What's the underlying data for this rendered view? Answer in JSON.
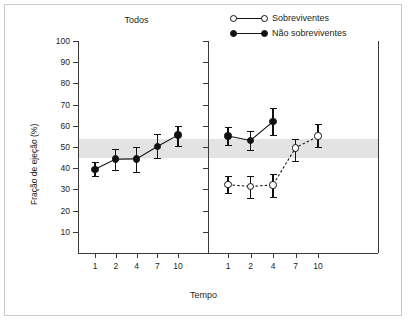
{
  "figure": {
    "xlabel": "Tempo",
    "ylabel": "Fração de ejeção (%)",
    "panel_title": "Todos"
  },
  "legend": {
    "position": "top-right",
    "items": [
      {
        "label": "Sobreviventes",
        "marker": "open-circle",
        "line": "dashed"
      },
      {
        "label": "Não sobreviventes",
        "marker": "filled-circle",
        "line": "solid"
      }
    ]
  },
  "chart_data": {
    "type": "line",
    "title": "",
    "xlabel": "Tempo",
    "ylabel": "Fração de ejeção (%)",
    "ylim": [
      0,
      100
    ],
    "yticks": [
      10,
      20,
      30,
      40,
      50,
      60,
      70,
      80,
      90,
      100
    ],
    "ytick_labels": [
      "10",
      "20",
      "30",
      "40",
      "50",
      "60",
      "70",
      "80",
      "90",
      "100"
    ],
    "grid": false,
    "legend_position": "top-right",
    "reference_band": {
      "label": "",
      "ymin": 45,
      "ymax": 54,
      "color": "#e3e3e3"
    },
    "panels": [
      {
        "name": "Todos",
        "title": "Todos",
        "categories": [
          "1",
          "2",
          "4",
          "7",
          "10"
        ],
        "x": [
          1,
          2,
          4,
          7,
          10
        ],
        "xtick_labels": [
          "1",
          "2",
          "4",
          "7",
          "10"
        ],
        "series": [
          {
            "name": "Todos",
            "marker": "filled-circle",
            "line": "solid",
            "values": [
              39.5,
              44.3,
              44.4,
              50.2,
              55.6
            ],
            "err_low": [
              36.5,
              39.2,
              38.3,
              44.8,
              50.5
            ],
            "err_high": [
              43.0,
              49.0,
              50.1,
              56.0,
              60.0
            ]
          }
        ]
      },
      {
        "name": "Sobrevivencia",
        "title": "",
        "categories": [
          "1",
          "2",
          "4",
          "7",
          "10"
        ],
        "x": [
          1,
          2,
          4,
          7,
          10
        ],
        "xtick_labels": [
          "1",
          "2",
          "4",
          "7",
          "10"
        ],
        "series": [
          {
            "name": "Não sobreviventes",
            "marker": "filled-circle",
            "line": "solid",
            "values": [
              55.2,
              53.1,
              62.0
            ],
            "err_low": [
              51.0,
              48.8,
              55.6
            ],
            "err_high": [
              59.5,
              57.6,
              68.5
            ]
          },
          {
            "name": "Sobreviventes",
            "marker": "open-circle",
            "line": "dashed",
            "values": [
              32.2,
              31.4,
              32.1,
              49.6,
              55.1
            ],
            "err_low": [
              28.3,
              26.0,
              26.6,
              43.3,
              50.1
            ],
            "err_high": [
              36.3,
              36.5,
              37.5,
              54.0,
              61.0
            ]
          }
        ]
      }
    ]
  }
}
